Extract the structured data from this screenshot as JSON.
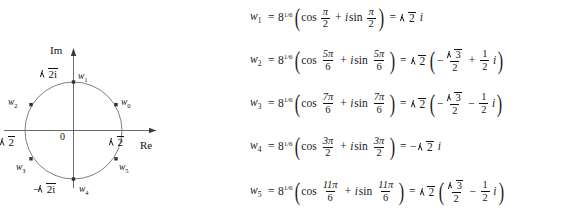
{
  "figure": {
    "type": "argand-diagram",
    "axis_labels": {
      "imaginary": "Im",
      "real": "Re"
    },
    "origin_label": "0",
    "axis_ticks": [
      {
        "name": "pos-imag-tick",
        "text": "2i",
        "radical": true
      },
      {
        "name": "neg-imag-tick",
        "text": "2i",
        "radical": true,
        "negative": true
      },
      {
        "name": "pos-real-tick",
        "text": "2",
        "radical": true
      },
      {
        "name": "neg-real-tick",
        "text": "2",
        "radical": true
      }
    ],
    "radius_value": "√2",
    "points": [
      {
        "label": "w",
        "sub": "0",
        "angle_deg": 30
      },
      {
        "label": "w",
        "sub": "1",
        "angle_deg": 90
      },
      {
        "label": "w",
        "sub": "2",
        "angle_deg": 150
      },
      {
        "label": "w",
        "sub": "3",
        "angle_deg": 210
      },
      {
        "label": "w",
        "sub": "4",
        "angle_deg": 270
      },
      {
        "label": "w",
        "sub": "5",
        "angle_deg": 330
      }
    ]
  },
  "equations": [
    {
      "name": "w1",
      "w_label": "w",
      "w_sub": "1",
      "base": "8",
      "exponent": "1/6",
      "cos": "cos",
      "sin": "sin",
      "angle_num": "π",
      "angle_den": "2",
      "result_radicand": "2",
      "result_suffix": "i",
      "result_kind": "pure-imaginary"
    },
    {
      "name": "w2",
      "w_label": "w",
      "w_sub": "2",
      "base": "8",
      "exponent": "1/6",
      "cos": "cos",
      "sin": "sin",
      "angle_num": "5π",
      "angle_den": "6",
      "result_radicand": "2",
      "real_sign": "−",
      "real_num": "3",
      "real_den": "2",
      "imag_sign": "+",
      "imag_num": "1",
      "imag_den": "2",
      "result_suffix": "i",
      "result_kind": "complex"
    },
    {
      "name": "w3",
      "w_label": "w",
      "w_sub": "3",
      "base": "8",
      "exponent": "1/6",
      "cos": "cos",
      "sin": "sin",
      "angle_num": "7π",
      "angle_den": "6",
      "result_radicand": "2",
      "real_sign": "−",
      "real_num": "3",
      "real_den": "2",
      "imag_sign": "−",
      "imag_num": "1",
      "imag_den": "2",
      "result_suffix": "i",
      "result_kind": "complex"
    },
    {
      "name": "w4",
      "w_label": "w",
      "w_sub": "4",
      "base": "8",
      "exponent": "1/6",
      "cos": "cos",
      "sin": "sin",
      "angle_num": "3π",
      "angle_den": "2",
      "result_radicand": "2",
      "result_sign": "−",
      "result_suffix": "i",
      "result_kind": "pure-imaginary-negative"
    },
    {
      "name": "w5",
      "w_label": "w",
      "w_sub": "5",
      "base": "8",
      "exponent": "1/6",
      "cos": "cos",
      "sin": "sin",
      "angle_num": "11π",
      "angle_den": "6",
      "result_radicand": "2",
      "real_sign": "",
      "real_num": "3",
      "real_den": "2",
      "imag_sign": "−",
      "imag_num": "1",
      "imag_den": "2",
      "result_suffix": "i",
      "result_kind": "complex"
    }
  ],
  "colors": {
    "ink": "#1a1a1a",
    "curve": "#6b6b6b",
    "axis": "#555555",
    "background": "#ffffff"
  }
}
